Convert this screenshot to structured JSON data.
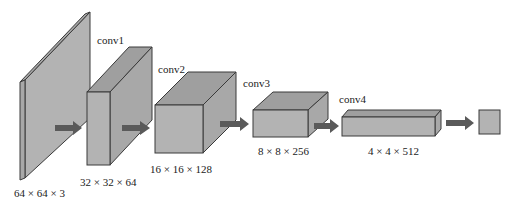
{
  "diagram": {
    "type": "cnn-architecture",
    "colors": {
      "block_fill": "#b3b3b3",
      "block_stroke": "#3a3a3a",
      "arrow": "#5a5a5a"
    },
    "layers": [
      {
        "id": "input",
        "name": "",
        "shape": "64 × 64 × 3"
      },
      {
        "id": "conv1",
        "name": "conv1",
        "shape": "32 × 32 × 64"
      },
      {
        "id": "conv2",
        "name": "conv2",
        "shape": "16 × 16 × 128"
      },
      {
        "id": "conv3",
        "name": "conv3",
        "shape": "8 × 8 × 256"
      },
      {
        "id": "conv4",
        "name": "conv4",
        "shape": "4 × 4 × 512"
      },
      {
        "id": "output",
        "name": "",
        "shape": ""
      }
    ]
  }
}
